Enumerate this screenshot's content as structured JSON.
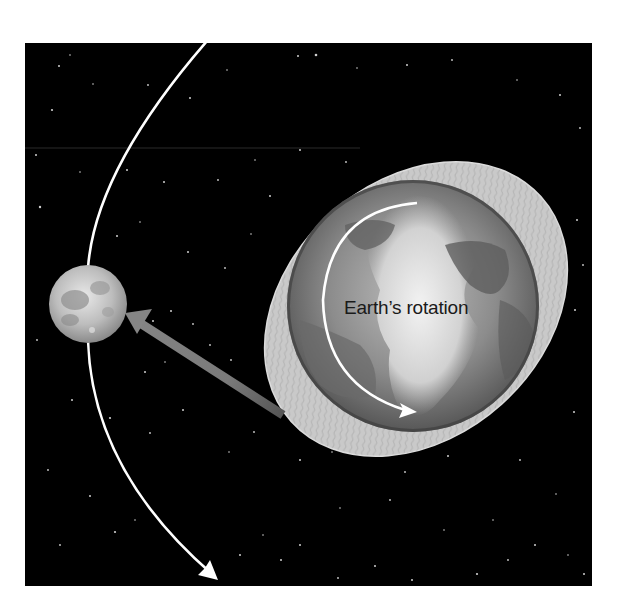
{
  "figure": {
    "labels": {
      "rotation": "Earth’s rotation"
    },
    "elements": {
      "background": "starfield",
      "moon": "moon",
      "earth": "earth",
      "tidal_bulge": "tidal-bulge",
      "orbit_path": "moon-orbit-arrow",
      "rotation_arrow": "earth-rotation-arrow",
      "gravity_arrow": "tidal-pull-arrow"
    },
    "colors": {
      "space": "#000000",
      "orbit": "#ffffff",
      "bulge": "#c8c8c8",
      "earth": "#7a7a7a",
      "pull_arrow": "#7d7d7d",
      "label": "#1a1a1a"
    }
  }
}
